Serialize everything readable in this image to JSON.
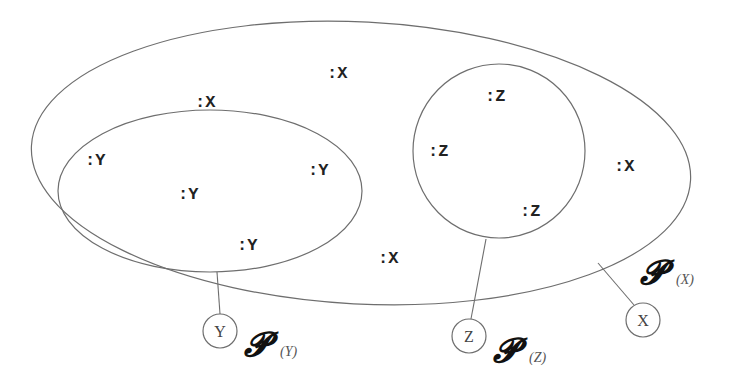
{
  "diagram": {
    "type": "nested-sets",
    "outer_set": {
      "label": "X",
      "powerset_symbol": "𝓟",
      "powerset_subscript": "(X)",
      "instances": [
        ":X",
        ":X",
        ":X",
        ":X",
        ":X"
      ]
    },
    "subset_y": {
      "label": "Y",
      "powerset_symbol": "𝓟",
      "powerset_subscript": "(Y)",
      "instances": [
        ":Y",
        ":Y",
        ":Y",
        ":Y"
      ]
    },
    "subset_z": {
      "label": "Z",
      "powerset_symbol": "𝓟",
      "powerset_subscript": "(Z)",
      "instances": [
        ":Z",
        ":Z",
        ":Z"
      ]
    },
    "colors": {
      "stroke": "#6e6e6e",
      "text": "#222222",
      "background": "#ffffff"
    }
  }
}
